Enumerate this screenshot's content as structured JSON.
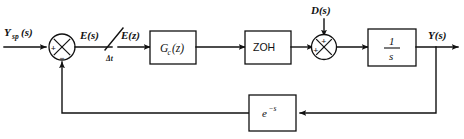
{
  "diagram": {
    "background_color": "#ffffff",
    "line_color": "#111111",
    "signals": {
      "setpoint": "Y",
      "setpoint_sub": "sp",
      "setpoint_arg": "(s)",
      "error_s": "E(s)",
      "error_z": "E(z)",
      "sample_period": "Δt",
      "disturbance": "D(s)",
      "output": "Y(s)"
    },
    "blocks": [
      {
        "id": "controller",
        "label": "G",
        "label_sub": "c",
        "label_arg": "(z)",
        "full": "Gc(z)"
      },
      {
        "id": "hold",
        "label": "ZOH",
        "full": "ZOH"
      },
      {
        "id": "plant",
        "numerator": "1",
        "denominator": "s",
        "full": "1/s"
      },
      {
        "id": "feedback",
        "label": "e",
        "exponent": "−s",
        "full": "e^-s"
      }
    ],
    "summing_junctions": [
      {
        "id": "error-junction",
        "signs": {
          "left": "+",
          "bottom": "−"
        }
      },
      {
        "id": "disturbance-junction",
        "signs": {
          "left": "+",
          "top": "+"
        }
      }
    ],
    "switch": {
      "id": "sampler",
      "label": "Δt"
    }
  }
}
